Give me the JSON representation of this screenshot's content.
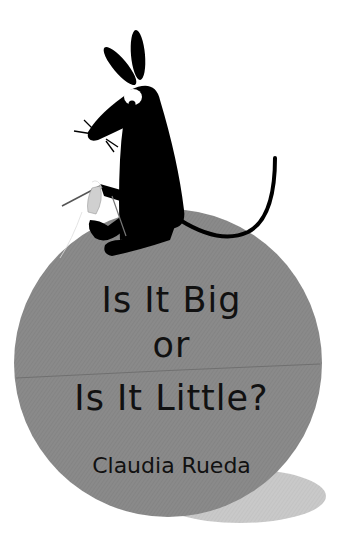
{
  "cover": {
    "title_lines": [
      "Is It Big",
      "or",
      "Is It Little?"
    ],
    "author": "Claudia Rueda",
    "illustration": "mouse-knitting-on-ball"
  },
  "colors": {
    "background": "#ffffff",
    "ball": "#8a8a8a",
    "shadow": "#c8c8c8",
    "mouse": "#000000",
    "text": "#111111"
  }
}
